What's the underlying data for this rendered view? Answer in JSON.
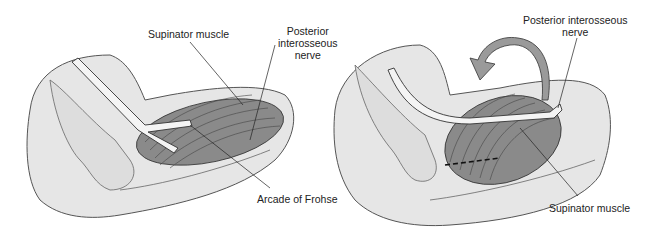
{
  "left_panel": {
    "labels": {
      "supinator": "Supinator muscle",
      "pin_line1": "Posterior",
      "pin_line2": "interosseous",
      "pin_line3": "nerve",
      "arcade": "Arcade of Frohse"
    }
  },
  "right_panel": {
    "labels": {
      "pin_line1": "Posterior interosseous",
      "pin_line2": "nerve",
      "supinator": "Supinator muscle"
    }
  },
  "colors": {
    "skin": "#e6e6e6",
    "skin_edge": "#555555",
    "muscle": "#8a8a8a",
    "nerve": "#f4f4f4",
    "arrow": "#9a9a9a"
  }
}
